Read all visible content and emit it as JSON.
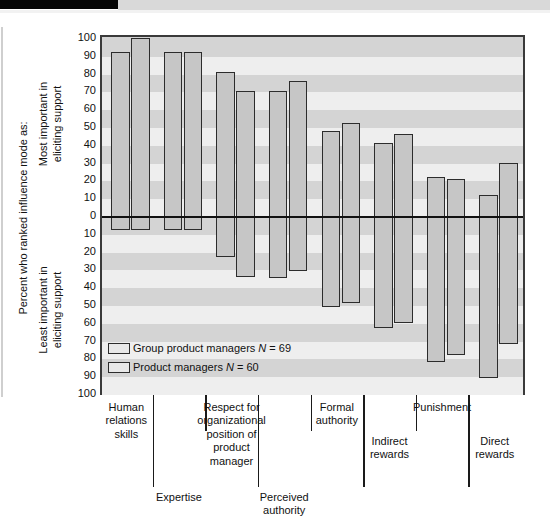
{
  "figure": {
    "y_axis_title": "Percent who ranked influence mode as:",
    "y_axis_top_label": "Most important in\neliciting support",
    "y_axis_bottom_label": "Least important in\neliciting support",
    "y_ticks": [
      "100",
      "90",
      "80",
      "70",
      "60",
      "50",
      "40",
      "30",
      "20",
      "10",
      "0",
      "10",
      "20",
      "30",
      "40",
      "50",
      "60",
      "70",
      "80",
      "90",
      "100"
    ]
  },
  "legend": {
    "position": "inside-bottom-left",
    "items": [
      {
        "label": "Group product managers ",
        "italic_n": "N",
        "rest": " = 69",
        "series": "Group product managers",
        "n": 69
      },
      {
        "label": "Product managers ",
        "italic_n": "N",
        "rest": " = 60",
        "series": "Product managers",
        "n": 60
      }
    ]
  },
  "colors": {
    "bar_fill": "#c6c6c6",
    "bar_stroke": "#2c2c2c",
    "plot_background": "#d4d4d4",
    "band": "#eeeeee",
    "zero_line": "#111111"
  },
  "chart_data": {
    "type": "bar",
    "title": "",
    "xlabel": "",
    "ylabel": "Percent who ranked influence mode as:",
    "ylim": [
      -100,
      100
    ],
    "grid": true,
    "legend_position": "inside bottom-left",
    "note": "Diverging bar chart: positive values = percent ranking the influence mode Most important in eliciting support; negative values = percent ranking it Least important in eliciting support.",
    "categories": [
      "Human relations skills",
      "Expertise",
      "Respect for organizational position of product manager",
      "Perceived authority",
      "Formal authority",
      "Indirect rewards",
      "Punishment",
      "Direct rewards"
    ],
    "category_label_lines": [
      "Human\nrelations\nskills",
      "Expertise",
      "Respect for\norganizational\nposition of\nproduct\nmanager",
      "Perceived\nauthority",
      "Formal\nauthority",
      "Indirect\nrewards",
      "Punishment",
      "Direct\nrewards"
    ],
    "series": [
      {
        "name": "Group product managers",
        "n": 69,
        "most_important": [
          92,
          92,
          81,
          70,
          48,
          41,
          22,
          12
        ],
        "least_important": [
          -8,
          -8,
          -23,
          -35,
          -51,
          -63,
          -82,
          -91
        ]
      },
      {
        "name": "Product managers",
        "n": 60,
        "most_important": [
          100,
          92,
          70,
          76,
          52,
          46,
          21,
          30
        ],
        "least_important": [
          -8,
          -8,
          -34,
          -31,
          -49,
          -60,
          -78,
          -72
        ]
      }
    ]
  }
}
